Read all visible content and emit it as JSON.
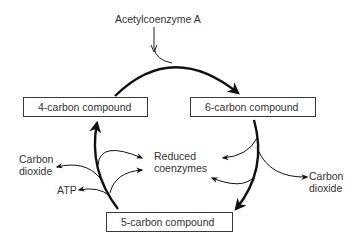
{
  "diagram": {
    "input": {
      "label": "Acetylcoenzyme A"
    },
    "nodes": [
      {
        "id": "c4",
        "label": "4-carbon compound"
      },
      {
        "id": "c6",
        "label": "6-carbon compound"
      },
      {
        "id": "c5",
        "label": "5-carbon compound"
      }
    ],
    "outputs": {
      "left_co2": "Carbon\ndioxide",
      "left_co2_line1": "Carbon",
      "left_co2_line2": "dioxide",
      "atp": "ATP",
      "reduced_line1": "Reduced",
      "reduced_line2": "coenzymes",
      "right_co2_line1": "Carbon",
      "right_co2_line2": "dioxide"
    },
    "edges": [
      {
        "from": "Acetylcoenzyme A",
        "to": "6-carbon compound",
        "type": "input"
      },
      {
        "from": "4-carbon compound",
        "to": "6-carbon compound",
        "type": "cycle"
      },
      {
        "from": "6-carbon compound",
        "to": "5-carbon compound",
        "type": "cycle"
      },
      {
        "from": "5-carbon compound",
        "to": "4-carbon compound",
        "type": "cycle"
      },
      {
        "from": "6-carbon compound",
        "to": "Reduced coenzymes",
        "type": "output"
      },
      {
        "from": "6-carbon compound",
        "to": "Carbon dioxide",
        "type": "output"
      },
      {
        "from": "5-carbon compound",
        "to": "Reduced coenzymes",
        "type": "output"
      },
      {
        "from": "5-carbon compound",
        "to": "Carbon dioxide",
        "type": "output"
      },
      {
        "from": "5-carbon compound",
        "to": "ATP",
        "type": "output"
      }
    ],
    "colors": {
      "line": "#111111",
      "box_border": "#3a3a3a",
      "text": "#333333",
      "background": "#ffffff"
    }
  }
}
